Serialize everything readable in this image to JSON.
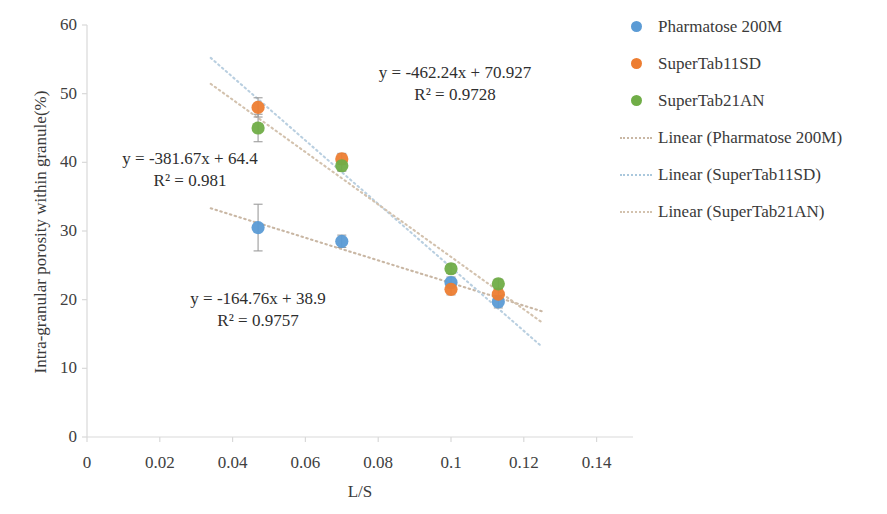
{
  "chart_data": {
    "type": "scatter",
    "title": "",
    "xlabel": "L/S",
    "ylabel": "Intra-granular porosity within granule(%)",
    "xlim": [
      0,
      0.15
    ],
    "ylim": [
      0,
      60
    ],
    "xticks": [
      "0",
      "0.02",
      "0.04",
      "0.06",
      "0.08",
      "0.1",
      "0.12",
      "0.14"
    ],
    "xtick_values": [
      0,
      0.02,
      0.04,
      0.06,
      0.08,
      0.1,
      0.12,
      0.14
    ],
    "yticks": [
      "0",
      "10",
      "20",
      "30",
      "40",
      "50",
      "60"
    ],
    "ytick_values": [
      0,
      10,
      20,
      30,
      40,
      50,
      60
    ],
    "grid": false,
    "legend_position": "right",
    "series": [
      {
        "name": "Pharmatose 200M",
        "color": "#5B9BD5",
        "marker": "circle",
        "x": [
          0.047,
          0.07,
          0.1,
          0.113
        ],
        "y": [
          30.5,
          28.5,
          22.5,
          19.7
        ],
        "yerr": [
          3.4,
          0.9,
          0.8,
          0.9
        ],
        "trendline": {
          "label": "Linear (Pharmatose 200M)",
          "equation": "y = -164.76x + 38.9",
          "r2": "R² = 0.9757",
          "slope": -164.76,
          "intercept": 38.9,
          "color": "#c9b7a4"
        }
      },
      {
        "name": "SuperTab11SD",
        "color": "#ED7D31",
        "marker": "circle",
        "x": [
          0.047,
          0.07,
          0.1,
          0.113
        ],
        "y": [
          48.0,
          40.5,
          21.5,
          20.8
        ],
        "yerr": [
          1.4,
          0.8,
          0.8,
          0.7
        ],
        "trendline": {
          "label": "Linear (SuperTab11SD)",
          "equation": "y = -462.24x + 70.927",
          "r2": "R² = 0.9728",
          "slope": -462.24,
          "intercept": 70.927,
          "color": "#b9cfe0"
        }
      },
      {
        "name": "SuperTab21AN",
        "color": "#70AD47",
        "marker": "circle",
        "x": [
          0.047,
          0.07,
          0.1,
          0.113
        ],
        "y": [
          45.0,
          39.5,
          24.5,
          22.3
        ],
        "yerr": [
          2.0,
          0.8,
          0.7,
          0.7
        ],
        "trendline": {
          "label": "Linear (SuperTab21AN)",
          "equation": "y = -381.67x + 64.4",
          "r2": "R² = 0.981",
          "slope": -381.67,
          "intercept": 64.4,
          "color": "#d3c2ae"
        }
      }
    ],
    "annotations": [
      {
        "id": "eq-supertab11sd",
        "line1": "y = -462.24x + 70.927",
        "line2": "R² = 0.9728",
        "x_px": 455,
        "y_px": 62
      },
      {
        "id": "eq-supertab21an",
        "line1": "y = -381.67x + 64.4",
        "line2": "R² = 0.981",
        "x_px": 190,
        "y_px": 148
      },
      {
        "id": "eq-pharmatose200m",
        "line1": "y = -164.76x + 38.9",
        "line2": "R² = 0.9757",
        "x_px": 258,
        "y_px": 288
      }
    ]
  },
  "legend": {
    "entries": [
      {
        "label": "Pharmatose 200M",
        "type": "marker",
        "color": "#5B9BD5"
      },
      {
        "label": "SuperTab11SD",
        "type": "marker",
        "color": "#ED7D31"
      },
      {
        "label": "SuperTab21AN",
        "type": "marker",
        "color": "#70AD47"
      },
      {
        "label": "Linear (Pharmatose 200M)",
        "type": "line",
        "color": "#c9b7a4"
      },
      {
        "label": "Linear (SuperTab11SD)",
        "type": "line",
        "color": "#aac8dd"
      },
      {
        "label": "Linear (SuperTab21AN)",
        "type": "line",
        "color": "#d3c2ae"
      }
    ]
  }
}
